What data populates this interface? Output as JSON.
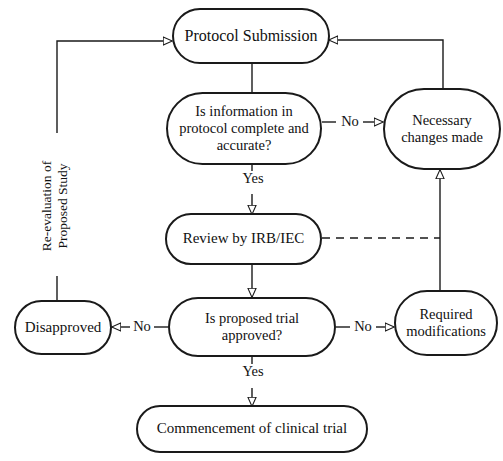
{
  "diagram": {
    "accent_color": "#1a1a1a",
    "background_color": "#ffffff",
    "nodes": [
      {
        "id": "protocol_submission",
        "label": "Protocol Submission",
        "shape": "stadium"
      },
      {
        "id": "info_complete",
        "label": "Is information in protocol complete and accurate?",
        "shape": "stadium"
      },
      {
        "id": "necessary_changes",
        "label": "Necessary changes made",
        "shape": "stadium"
      },
      {
        "id": "review_irb",
        "label": "Review by IRB/IEC",
        "shape": "stadium"
      },
      {
        "id": "trial_approved",
        "label": "Is proposed trial approved?",
        "shape": "stadium"
      },
      {
        "id": "disapproved",
        "label": "Disapproved",
        "shape": "stadium"
      },
      {
        "id": "required_modifications",
        "label": "Required modifications",
        "shape": "stadium"
      },
      {
        "id": "commencement",
        "label": "Commencement of clinical trial",
        "shape": "stadium"
      }
    ],
    "edge_labels": {
      "no_info_complete": "No",
      "yes_info_complete": "Yes",
      "no_approved_left": "No",
      "no_approved_right": "No",
      "yes_approved": "Yes"
    },
    "annotations": {
      "reevaluation_line1": "Re-evaluation of",
      "reevaluation_line2": "Proposed Study"
    }
  }
}
